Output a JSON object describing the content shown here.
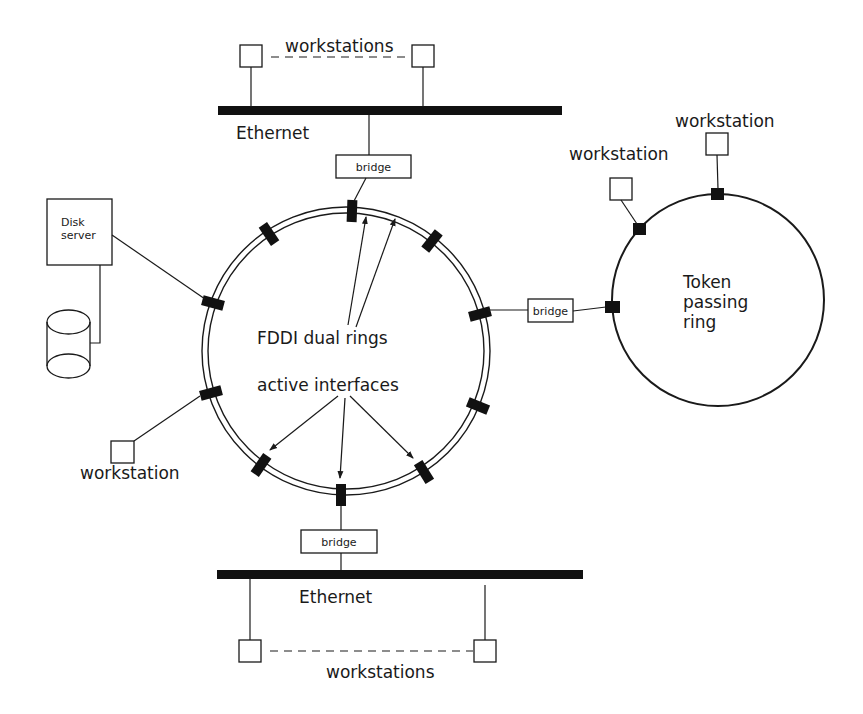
{
  "diagram": {
    "type": "network-topology",
    "colors": {
      "line": "#1a1a1a",
      "port": "#111111",
      "background": "#ffffff"
    },
    "top_segment": {
      "network_label": "Ethernet",
      "workstations_label": "workstations",
      "bridge_label": "bridge"
    },
    "bottom_segment": {
      "network_label": "Ethernet",
      "workstations_label": "workstations",
      "bridge_label": "bridge"
    },
    "fddi": {
      "label_rings": "FDDI dual rings",
      "label_interfaces": "active interfaces",
      "port_count": 10
    },
    "disk_server": {
      "label_line1": "Disk",
      "label_line2": "server",
      "storage_icon": "disk-cylinder-icon"
    },
    "left_workstation": {
      "label": "workstation"
    },
    "right_bridge": {
      "label": "bridge"
    },
    "token_ring": {
      "label_line1": "Token",
      "label_line2": "passing",
      "label_line3": "ring",
      "workstation_labels": [
        "workstation",
        "workstation"
      ]
    }
  }
}
